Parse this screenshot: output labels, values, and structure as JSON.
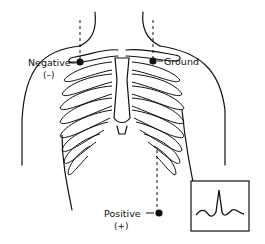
{
  "diagram": {
    "electrodes": [
      {
        "id": "negative",
        "label": "Negative",
        "sign": "(–)"
      },
      {
        "id": "ground",
        "label": "Ground",
        "sign": ""
      },
      {
        "id": "positive",
        "label": "Positive",
        "sign": "(+)"
      }
    ],
    "inset": {
      "name": "ecg-waveform",
      "description": "QRS complex tracing"
    },
    "colors": {
      "line": "#111111",
      "background": "#ffffff"
    }
  }
}
